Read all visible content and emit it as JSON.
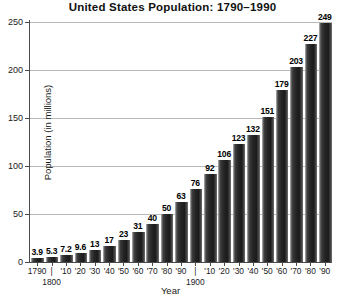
{
  "chart_data": {
    "type": "bar",
    "title": "United States Population: 1790–1990",
    "xlabel": "Year",
    "ylabel": "Population (in millions)",
    "ylim": [
      0,
      250
    ],
    "yticks": [
      0,
      50,
      100,
      150,
      200,
      250
    ],
    "grid": true,
    "legend": null,
    "categories": [
      "1790",
      "1800",
      "1810",
      "1820",
      "1830",
      "1840",
      "1850",
      "1860",
      "1870",
      "1880",
      "1890",
      "1900",
      "1910",
      "1920",
      "1930",
      "1940",
      "1950",
      "1960",
      "1970",
      "1980",
      "1990"
    ],
    "tick_labels": [
      "1790",
      "|",
      "'10",
      "'20",
      "'30",
      "'40",
      "'50",
      "'60",
      "'70",
      "'80",
      "'90",
      "|",
      "'10",
      "'20",
      "'30",
      "'40",
      "'50",
      "'60",
      "'70",
      "'80",
      "'90"
    ],
    "sub_tick_labels": {
      "1": "1800",
      "11": "1900"
    },
    "values": [
      3.9,
      5.3,
      7.2,
      9.6,
      13,
      17,
      23,
      31,
      40,
      50,
      63,
      76,
      92,
      106,
      123,
      132,
      151,
      179,
      203,
      227,
      249
    ],
    "value_labels": [
      "3.9",
      "5.3",
      "7.2",
      "9.6",
      "13",
      "17",
      "23",
      "31",
      "40",
      "50",
      "63",
      "76",
      "92",
      "106",
      "123",
      "132",
      "151",
      "179",
      "203",
      "227",
      "249"
    ],
    "bar_color": "#242424",
    "grid_color": "#b9b9b9",
    "axis_color": "#4a4a4a",
    "background": "#ffffff"
  }
}
